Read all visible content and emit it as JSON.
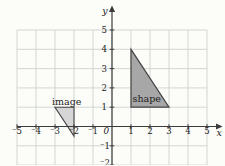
{
  "page": {
    "heading_cropped": "the coordinates of the centre of enlargement.",
    "part_label": "a"
  },
  "figure": {
    "axes": {
      "x_label": "x",
      "y_label": "y",
      "origin_label": "0",
      "x_range": [
        -5,
        5
      ],
      "y_range": [
        -2,
        5
      ],
      "grid": true,
      "x_tick_labels_neg": [
        "⁻5",
        "⁻4",
        "⁻3",
        "⁻2",
        "⁻1"
      ],
      "x_tick_labels_pos": [
        "1",
        "2",
        "3",
        "4",
        "5"
      ],
      "y_tick_labels_pos": [
        "5",
        "4",
        "3",
        "2",
        "1"
      ],
      "y_tick_labels_neg": [
        "⁻1",
        "⁻2"
      ]
    },
    "shapes": [
      {
        "name": "shape",
        "label": "shape",
        "vertices": [
          [
            1,
            4
          ],
          [
            1,
            1
          ],
          [
            3,
            1
          ]
        ],
        "fill": "#a7a7a7"
      },
      {
        "name": "image",
        "label": "image",
        "vertices": [
          [
            -3,
            1
          ],
          [
            -2,
            1
          ],
          [
            -2,
            -0.5
          ]
        ],
        "fill": "#d6d6d6"
      }
    ],
    "colors": {
      "grid": "#cdd2cd",
      "axis": "#3b3b3b",
      "outline": "#454545",
      "background": "#fcfcf9"
    }
  }
}
